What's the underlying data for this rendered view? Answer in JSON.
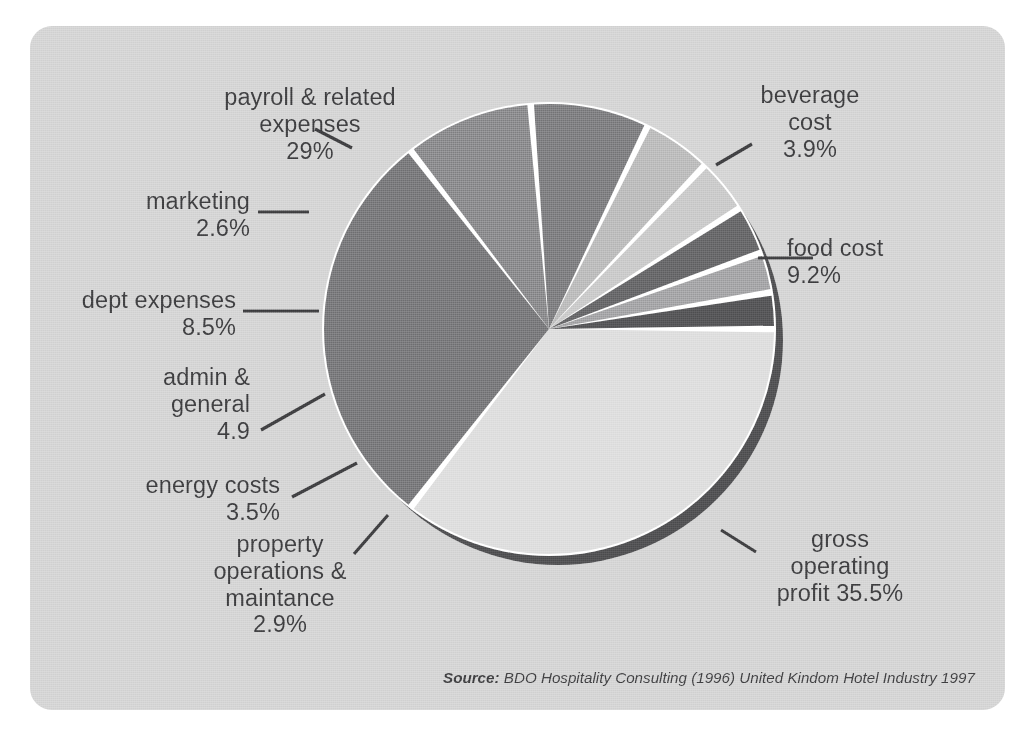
{
  "figure": {
    "background_color": "#d0d0d0",
    "page_color": "#ffffff",
    "text_color": "#39393b",
    "separator_color": "#ffffff",
    "shadow_color": "#4a4a4c"
  },
  "source": {
    "prefix": "Source:",
    "citation": "BDO Hospitality Consulting (1996) United Kindom Hotel Industry 1997"
  },
  "chart_data": {
    "type": "pie",
    "title": "",
    "subtitle": "",
    "xlabel": "",
    "ylabel": "",
    "legend_position": "callout-labels",
    "grid": false,
    "units": "percent",
    "start_angle_deg": 0,
    "direction": "clockwise",
    "total": 100.0,
    "categories": [
      "gross operating profit",
      "payroll & related expenses",
      "food cost",
      "dept expenses",
      "admin & general",
      "beverage cost",
      "energy costs",
      "property operations & maintance",
      "marketing"
    ],
    "values": [
      35.5,
      29,
      9.2,
      8.5,
      4.9,
      3.9,
      3.5,
      2.9,
      2.6
    ],
    "slices": [
      {
        "name": "gross operating profit",
        "label_lines": [
          "gross",
          "operating",
          "profit 35.5%"
        ],
        "value": 35.5,
        "value_text": "35.5%",
        "color": "#dadada"
      },
      {
        "name": "payroll & related expenses",
        "label_lines": [
          "payroll & related",
          "expenses",
          "29%"
        ],
        "value": 29,
        "value_text": "29%",
        "color": "#6e6e70"
      },
      {
        "name": "food cost",
        "label_lines": [
          "food cost",
          "9.2%"
        ],
        "value": 9.2,
        "value_text": "9.2%",
        "color": "#7e7e80"
      },
      {
        "name": "dept expenses",
        "label_lines": [
          "dept expenses",
          "8.5%"
        ],
        "value": 8.5,
        "value_text": "8.5%",
        "color": "#737375"
      },
      {
        "name": "admin & general",
        "label_lines": [
          "admin &",
          "general",
          "4.9"
        ],
        "value": 4.9,
        "value_text": "4.9",
        "color": "#b4b4b4"
      },
      {
        "name": "beverage cost",
        "label_lines": [
          "beverage",
          "cost",
          "3.9%"
        ],
        "value": 3.9,
        "value_text": "3.9%",
        "color": "#c4c4c4"
      },
      {
        "name": "energy costs",
        "label_lines": [
          "energy costs",
          "3.5%"
        ],
        "value": 3.5,
        "value_text": "3.5%",
        "color": "#5e5e60"
      },
      {
        "name": "property operations & maintance",
        "label_lines": [
          "property",
          "operations &",
          "maintance",
          "2.9%"
        ],
        "value": 2.9,
        "value_text": "2.9%",
        "color": "#9a9a9c"
      },
      {
        "name": "marketing",
        "label_lines": [
          "marketing",
          "2.6%"
        ],
        "value": 2.6,
        "value_text": "2.6%",
        "color": "#4e4e50"
      }
    ]
  },
  "labels": {
    "payroll": "payroll & related\nexpenses\n29%",
    "marketing": "marketing\n2.6%",
    "dept_expenses": "dept expenses\n8.5%",
    "admin_general": "admin &\ngeneral\n4.9",
    "energy_costs": "energy costs\n3.5%",
    "property_ops": "property\noperations &\nmaintance\n2.9%",
    "beverage_cost": "beverage\ncost\n3.9%",
    "food_cost": "food cost\n9.2%",
    "gross_profit": "gross\noperating\nprofit 35.5%"
  }
}
